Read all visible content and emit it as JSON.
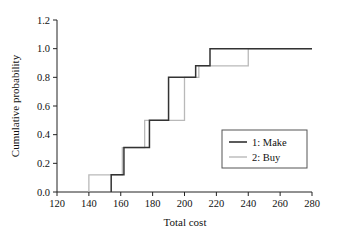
{
  "chart_data": {
    "type": "line",
    "subtype": "step-cdf",
    "title": "",
    "xlabel": "Total cost",
    "ylabel": "Cumulative probability",
    "xlim": [
      120,
      280
    ],
    "ylim": [
      0.0,
      1.2
    ],
    "xticks": [
      120,
      140,
      160,
      180,
      200,
      220,
      240,
      260,
      280
    ],
    "xtick_labels": [
      "120",
      "140",
      "160",
      "180",
      "200",
      "220",
      "240",
      "260",
      "280"
    ],
    "yticks": [
      0.0,
      0.2,
      0.4,
      0.6,
      0.8,
      1.0,
      1.2
    ],
    "ytick_labels": [
      "0.0",
      "0.2",
      "0.4",
      "0.6",
      "0.8",
      "1.0",
      "1.2"
    ],
    "grid": false,
    "legend_position": "center-right",
    "series": [
      {
        "name": "1: Make",
        "color": "#333333",
        "x": [
          154,
          154,
          162,
          162,
          178,
          178,
          190,
          190,
          207,
          207,
          216,
          216,
          280
        ],
        "y": [
          0.0,
          0.12,
          0.12,
          0.31,
          0.31,
          0.5,
          0.5,
          0.8,
          0.8,
          0.88,
          0.88,
          1.0,
          1.0
        ],
        "steps": [
          {
            "x": 154,
            "y": 0.12
          },
          {
            "x": 162,
            "y": 0.31
          },
          {
            "x": 178,
            "y": 0.5
          },
          {
            "x": 190,
            "y": 0.8
          },
          {
            "x": 207,
            "y": 0.88
          },
          {
            "x": 216,
            "y": 1.0
          }
        ]
      },
      {
        "name": "2: Buy",
        "color": "#b9b9b9",
        "x": [
          140,
          140,
          161,
          161,
          175,
          175,
          200,
          200,
          209,
          209,
          240,
          240,
          280
        ],
        "y": [
          0.0,
          0.12,
          0.12,
          0.31,
          0.31,
          0.5,
          0.5,
          0.8,
          0.8,
          0.88,
          0.88,
          1.0,
          1.0
        ],
        "steps": [
          {
            "x": 140,
            "y": 0.12
          },
          {
            "x": 161,
            "y": 0.31
          },
          {
            "x": 175,
            "y": 0.5
          },
          {
            "x": 200,
            "y": 0.8
          },
          {
            "x": 209,
            "y": 0.88
          },
          {
            "x": 240,
            "y": 1.0
          }
        ]
      }
    ]
  },
  "legend": {
    "entries": [
      {
        "label": "1: Make"
      },
      {
        "label": "2: Buy"
      }
    ]
  },
  "colors": {
    "make": "#333333",
    "buy": "#b9b9b9",
    "axis": "#222222",
    "background": "#ffffff"
  }
}
